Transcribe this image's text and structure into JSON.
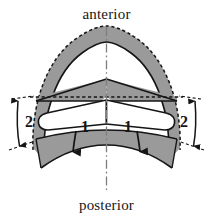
{
  "figure": {
    "background_color": "#ffffff",
    "ink_color": "#151515",
    "shade_color": "#9a9a9a",
    "shade_color_dark": "#8e8e8e",
    "fill_white": "#ffffff",
    "orientation_labels": {
      "top": "anterior",
      "bottom": "posterior"
    },
    "measurement_labels": {
      "leaflet_left": "1",
      "leaflet_right": "1",
      "height_left": "2",
      "height_right": "2"
    },
    "annotations": {
      "centerline_style": "dash-dot",
      "outer_contour_style": "dashed",
      "inner_contour_style": "solid",
      "motion_arrows": "downward"
    }
  }
}
